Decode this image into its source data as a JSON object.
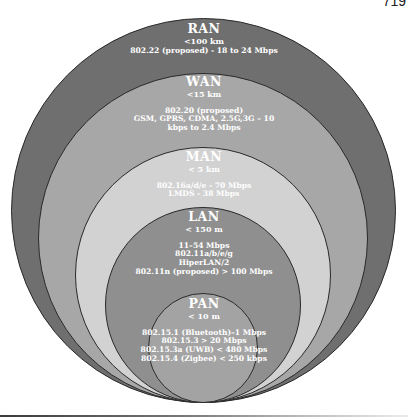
{
  "page": {
    "number": "719"
  },
  "diagram": {
    "colors": {
      "ran": "#6f6f6f",
      "wan": "#a7a7a7",
      "man": "#d2d2d2",
      "lan": "#8f8f8f",
      "pan": "#a3a3a3",
      "outline": "#2a2a2a"
    },
    "rings": [
      {
        "name": "RAN",
        "range": "<100 km",
        "details": [
          "802.22 (proposed) - 18 to 24 Mbps"
        ]
      },
      {
        "name": "WAN",
        "range": "<15 km",
        "details": [
          "802.20 (proposed)",
          "GSM, GPRS, CDMA, 2.5G,3G – 10",
          "kbps to 2.4 Mbps"
        ]
      },
      {
        "name": "MAN",
        "range": "< 5 km",
        "details": [
          "802.16a/d/e - 70 Mbps",
          "LMDS - 38 Mbps"
        ]
      },
      {
        "name": "LAN",
        "range": "< 150 m",
        "details": [
          "11–54 Mbps",
          "802.11a/b/e/g",
          "HiperLAN/2",
          "802.11n (proposed) > 100 Mbps"
        ]
      },
      {
        "name": "PAN",
        "range": "< 10 m",
        "details": [
          "802.15.1 (Bluetooth)–1 Mbps",
          "802.15.3 > 20 Mbps",
          "802.15.3a (UWB) < 480 Mbps",
          "802.15.4 (Zigbee) < 250 kbps"
        ]
      }
    ]
  }
}
